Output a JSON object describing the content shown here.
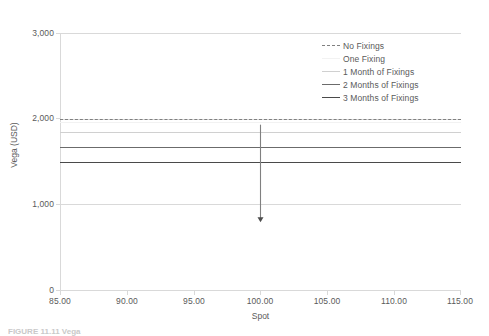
{
  "chart_data": {
    "type": "line",
    "title": "",
    "xlabel": "Spot",
    "ylabel": "Vega (USD)",
    "xlim": [
      85,
      115
    ],
    "ylim": [
      0,
      3000
    ],
    "grid": true,
    "legend_position": "top-right-inside",
    "x_ticks": [
      "85.00",
      "90.00",
      "95.00",
      "100.00",
      "105.00",
      "110.00",
      "115.00"
    ],
    "x_tick_values": [
      85,
      90,
      95,
      100,
      105,
      110,
      115
    ],
    "y_ticks": [
      "0",
      "1,000",
      "2,000",
      "3,000"
    ],
    "y_tick_values": [
      0,
      1000,
      2000,
      3000
    ],
    "x": [
      85,
      115
    ],
    "series": [
      {
        "name": "No Fixings",
        "values": [
          2000,
          2000
        ],
        "style": "dashed",
        "color": "#808080",
        "width": 1
      },
      {
        "name": "One Fixing",
        "values": [
          1960,
          1960
        ],
        "style": "solid",
        "color": "#f2f2f2",
        "width": 1
      },
      {
        "name": "1 Month of Fixings",
        "values": [
          1840,
          1840
        ],
        "style": "solid",
        "color": "#d0d0d0",
        "width": 1
      },
      {
        "name": "2 Months of Fixings",
        "values": [
          1672,
          1672
        ],
        "style": "solid",
        "color": "#6b6b6b",
        "width": 1
      },
      {
        "name": "3 Months of Fixings",
        "values": [
          1500,
          1500
        ],
        "style": "solid",
        "color": "#4a4a4a",
        "width": 1
      }
    ],
    "annotations": [
      {
        "kind": "arrow",
        "x": 100,
        "y_from": 1930,
        "y_to": 790,
        "color": "#808080"
      }
    ]
  },
  "caption": {
    "cut_off_text": "FIGURE 11.11  Vega"
  },
  "legend": {
    "items": [
      {
        "label": "No Fixings"
      },
      {
        "label": "One Fixing"
      },
      {
        "label": "1 Month of Fixings"
      },
      {
        "label": "2 Months of Fixings"
      },
      {
        "label": "3 Months of Fixings"
      }
    ]
  }
}
